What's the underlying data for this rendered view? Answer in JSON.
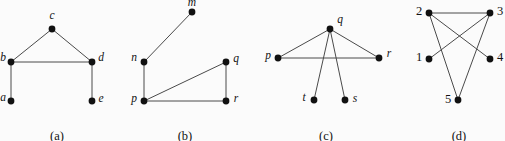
{
  "figure": {
    "width": 505,
    "height": 141,
    "background_color": "#fbfbfb",
    "edge_color": "#4a4a4a",
    "node_color": "#111111",
    "label_color": "#121212",
    "node_radius": 3.4,
    "edge_width": 1.0
  },
  "panels": [
    {
      "id": "a",
      "caption": "(a)",
      "caption_x": 57,
      "caption_y": 129,
      "nodes": [
        {
          "id": "c",
          "label": "c",
          "x": 52,
          "y": 29,
          "label_x": 52,
          "label_y": 16
        },
        {
          "id": "b",
          "label": "b",
          "x": 11,
          "y": 62,
          "label_x": 3,
          "label_y": 58
        },
        {
          "id": "d",
          "label": "d",
          "x": 92,
          "y": 62,
          "label_x": 101,
          "label_y": 58
        },
        {
          "id": "a",
          "label": "a",
          "x": 11,
          "y": 101,
          "label_x": 3,
          "label_y": 98
        },
        {
          "id": "e",
          "label": "e",
          "x": 92,
          "y": 101,
          "label_x": 101,
          "label_y": 99
        }
      ],
      "edges": [
        {
          "from": "b",
          "to": "c"
        },
        {
          "from": "c",
          "to": "d"
        },
        {
          "from": "b",
          "to": "d"
        },
        {
          "from": "b",
          "to": "a"
        },
        {
          "from": "d",
          "to": "e"
        }
      ]
    },
    {
      "id": "b",
      "caption": "(b)",
      "caption_x": 185,
      "caption_y": 129,
      "nodes": [
        {
          "id": "m",
          "label": "m",
          "x": 192,
          "y": 12,
          "label_x": 192,
          "label_y": 3
        },
        {
          "id": "n",
          "label": "n",
          "x": 144,
          "y": 62,
          "label_x": 134,
          "label_y": 58
        },
        {
          "id": "q",
          "label": "q",
          "x": 226,
          "y": 62,
          "label_x": 236,
          "label_y": 59
        },
        {
          "id": "p",
          "label": "p",
          "x": 144,
          "y": 101,
          "label_x": 134,
          "label_y": 99
        },
        {
          "id": "r",
          "label": "r",
          "x": 226,
          "y": 101,
          "label_x": 236,
          "label_y": 99
        }
      ],
      "edges": [
        {
          "from": "m",
          "to": "n"
        },
        {
          "from": "n",
          "to": "p"
        },
        {
          "from": "p",
          "to": "q"
        },
        {
          "from": "p",
          "to": "r"
        },
        {
          "from": "q",
          "to": "r"
        }
      ]
    },
    {
      "id": "c",
      "caption": "(c)",
      "caption_x": 326,
      "caption_y": 129,
      "nodes": [
        {
          "id": "q",
          "label": "q",
          "x": 330,
          "y": 29,
          "label_x": 340,
          "label_y": 20
        },
        {
          "id": "p",
          "label": "p",
          "x": 278,
          "y": 58,
          "label_x": 268,
          "label_y": 56
        },
        {
          "id": "r",
          "label": "r",
          "x": 379,
          "y": 58,
          "label_x": 389,
          "label_y": 54
        },
        {
          "id": "t",
          "label": "t",
          "x": 314,
          "y": 100,
          "label_x": 304,
          "label_y": 98
        },
        {
          "id": "s",
          "label": "s",
          "x": 345,
          "y": 100,
          "label_x": 355,
          "label_y": 99
        }
      ],
      "edges": [
        {
          "from": "p",
          "to": "q"
        },
        {
          "from": "q",
          "to": "r"
        },
        {
          "from": "p",
          "to": "r"
        },
        {
          "from": "q",
          "to": "t"
        },
        {
          "from": "q",
          "to": "s"
        }
      ]
    },
    {
      "id": "d",
      "caption": "(d)",
      "caption_x": 459,
      "caption_y": 129,
      "nodes": [
        {
          "id": "2",
          "label": "2",
          "x": 429,
          "y": 13,
          "label_x": 419,
          "label_y": 11
        },
        {
          "id": "3",
          "label": "3",
          "x": 490,
          "y": 13,
          "label_x": 500,
          "label_y": 11
        },
        {
          "id": "1",
          "label": "1",
          "x": 429,
          "y": 59,
          "label_x": 419,
          "label_y": 57
        },
        {
          "id": "4",
          "label": "4",
          "x": 490,
          "y": 59,
          "label_x": 500,
          "label_y": 57
        },
        {
          "id": "5",
          "label": "5",
          "x": 458,
          "y": 100,
          "label_x": 448,
          "label_y": 99
        }
      ],
      "edges": [
        {
          "from": "2",
          "to": "3"
        },
        {
          "from": "2",
          "to": "4"
        },
        {
          "from": "3",
          "to": "1"
        },
        {
          "from": "2",
          "to": "5"
        },
        {
          "from": "3",
          "to": "5"
        }
      ]
    }
  ]
}
